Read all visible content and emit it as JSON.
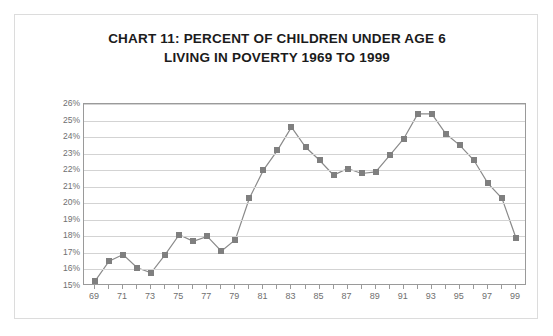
{
  "title": {
    "line1": "CHART 11:  PERCENT OF CHILDREN UNDER AGE 6",
    "line2": "LIVING IN POVERTY 1969 TO 1999"
  },
  "colors": {
    "marker": "#7f7f7f",
    "line": "#8a8a8a",
    "gridline": "#d3d3d3",
    "axis": "#9a9a9a",
    "title_text": "#1b1b1b",
    "tick_text": "#6f6f6f",
    "frame": "#dcdcdc",
    "background": "#ffffff"
  },
  "chart_data": {
    "type": "line",
    "title": "CHART 11:  PERCENT OF CHILDREN UNDER AGE 6 LIVING IN POVERTY 1969 TO 1999",
    "xlabel": "",
    "ylabel": "",
    "grid": true,
    "legend": "none",
    "marker": "square",
    "ylim": [
      15,
      26
    ],
    "ytick_labels": [
      "26%",
      "25%",
      "24%",
      "23%",
      "22%",
      "21%",
      "20%",
      "19%",
      "18%",
      "17%",
      "16%",
      "15%"
    ],
    "ytick_values": [
      26,
      25,
      24,
      23,
      22,
      21,
      20,
      19,
      18,
      17,
      16,
      15
    ],
    "xlim": [
      1969,
      1999
    ],
    "x": [
      1969,
      1970,
      1971,
      1972,
      1973,
      1974,
      1975,
      1976,
      1977,
      1978,
      1979,
      1980,
      1981,
      1982,
      1983,
      1984,
      1985,
      1986,
      1987,
      1988,
      1989,
      1990,
      1991,
      1992,
      1993,
      1994,
      1995,
      1996,
      1997,
      1998,
      1999
    ],
    "xtick_labels": [
      "69",
      "",
      "71",
      "",
      "73",
      "",
      "75",
      "",
      "77",
      "",
      "79",
      "",
      "81",
      "",
      "83",
      "",
      "85",
      "",
      "87",
      "",
      "89",
      "",
      "91",
      "",
      "93",
      "",
      "95",
      "",
      "97",
      "",
      "99"
    ],
    "values": [
      15.3,
      16.5,
      16.9,
      16.1,
      15.8,
      16.9,
      18.1,
      17.7,
      18.0,
      17.1,
      17.8,
      20.3,
      22.0,
      23.2,
      24.6,
      23.4,
      22.6,
      21.7,
      22.1,
      21.8,
      21.9,
      22.9,
      23.9,
      25.4,
      25.4,
      24.2,
      23.5,
      22.6,
      21.2,
      20.3,
      17.9
    ],
    "series": [
      {
        "name": "Percent of children under age 6 in poverty",
        "values": [
          15.3,
          16.5,
          16.9,
          16.1,
          15.8,
          16.9,
          18.1,
          17.7,
          18.0,
          17.1,
          17.8,
          20.3,
          22.0,
          23.2,
          24.6,
          23.4,
          22.6,
          21.7,
          22.1,
          21.8,
          21.9,
          22.9,
          23.9,
          25.4,
          25.4,
          24.2,
          23.5,
          22.6,
          21.2,
          20.3,
          17.9
        ]
      }
    ]
  }
}
